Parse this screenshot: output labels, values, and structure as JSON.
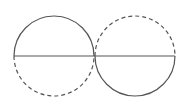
{
  "diagram": {
    "stroke_color": "#555555",
    "stroke_width": 1.2,
    "dash_pattern": "4 3",
    "circles": [
      {
        "name": "left-circle",
        "cx": 54,
        "cy": 56,
        "r": 40,
        "top_half": "solid",
        "bottom_half": "dashed"
      },
      {
        "name": "right-circle",
        "cx": 135,
        "cy": 56,
        "r": 40,
        "top_half": "dashed",
        "bottom_half": "solid"
      }
    ],
    "diameter_line": {
      "x1": 14,
      "y1": 56,
      "x2": 175,
      "y2": 56
    }
  }
}
